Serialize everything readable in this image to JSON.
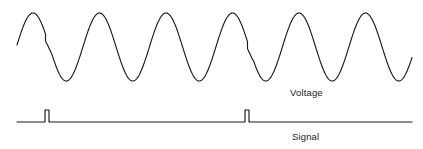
{
  "figure": {
    "width": 423,
    "height": 149,
    "background_color": "#ffffff",
    "stroke_color": "#1a1a1a",
    "text_color": "#1a1a1a"
  },
  "labels": {
    "voltage": "Voltage",
    "signal": "Signal"
  },
  "chart_data": {
    "type": "line",
    "title": "",
    "xlabel": "",
    "ylabel": "",
    "grid": false,
    "legend_position": "inline-right",
    "axis_ranges": {
      "x": [
        0,
        423
      ],
      "y_voltage": [
        13,
        81
      ],
      "y_signal": [
        110,
        122
      ]
    },
    "series": [
      {
        "name": "Voltage",
        "waveform": "sine-with-phase-steps",
        "x_start": 17,
        "x_end": 412,
        "baseline_y": 47,
        "amplitude": 34,
        "period": 66.5,
        "peak_y": 13,
        "trough_y": 81,
        "phase_steps": [
          {
            "x": 45.5,
            "drop_y": 7,
            "description": "phase-step discontinuity"
          },
          {
            "x": 247.5,
            "drop_y": 7,
            "description": "phase-step discontinuity"
          }
        ],
        "peaks_x": [
          33,
          100,
          166,
          233,
          299,
          366
        ],
        "troughs_x": [
          67,
          133,
          200,
          266,
          332,
          399
        ],
        "cycles": 6
      },
      {
        "name": "Signal",
        "waveform": "pulse-train",
        "x_start": 17,
        "x_end": 412,
        "baseline_y": 122,
        "pulse_height": 12,
        "pulse_width": 4,
        "pulses_x": [
          47,
          247
        ],
        "pulse_count": 2
      }
    ],
    "annotations": [
      {
        "text": "Voltage",
        "x": 290,
        "y": 92
      },
      {
        "text": "Signal",
        "x": 292,
        "y": 136
      }
    ]
  }
}
